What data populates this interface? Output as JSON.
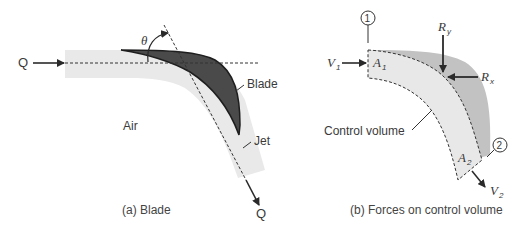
{
  "panel_a": {
    "caption": "(a) Blade",
    "labels": {
      "inflow": "Q",
      "outflow": "Q",
      "angle": "θ",
      "blade": "Blade",
      "jet": "Jet",
      "air": "Air"
    }
  },
  "panel_b": {
    "caption": "(b) Forces on control volume",
    "labels": {
      "section1": "1",
      "section2": "2",
      "v1": "V",
      "v1_sub": "1",
      "a1": "A",
      "a1_sub": "1",
      "ry": "R",
      "ry_sub": "y",
      "rx": "R",
      "rx_sub": "x",
      "control_volume": "Control volume",
      "a2": "A",
      "a2_sub": "2",
      "v2": "V",
      "v2_sub": "2"
    }
  },
  "colors": {
    "jet": "#e8e8e8",
    "blade": "#4a4a4a",
    "blade_region_b": "#bdbdbd",
    "line": "#2a2a2a"
  }
}
